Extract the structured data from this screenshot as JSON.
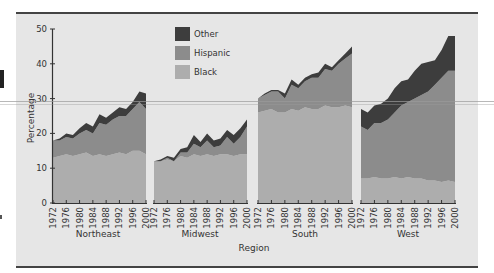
{
  "chart_data": {
    "type": "area",
    "stacked": true,
    "title": "",
    "xlabel": "Region",
    "ylabel": "Percentage",
    "ylim": [
      0,
      50
    ],
    "yticks": [
      0,
      10,
      20,
      30,
      40,
      50
    ],
    "x": [
      1972,
      1974,
      1976,
      1978,
      1980,
      1982,
      1984,
      1986,
      1988,
      1990,
      1992,
      1994,
      1996,
      1998,
      2000
    ],
    "xtick_labels": [
      "1972",
      "1976",
      "1980",
      "1984",
      "1988",
      "1992",
      "1996",
      "2000"
    ],
    "legend": {
      "position": "upper-center",
      "entries": [
        {
          "label": "Other",
          "color": "#3d3d3d"
        },
        {
          "label": "Hispanic",
          "color": "#8c8c8c"
        },
        {
          "label": "Black",
          "color": "#adadad"
        }
      ]
    },
    "panels": [
      {
        "region": "Northeast",
        "series": [
          {
            "name": "Black",
            "values": [
              13,
              13.5,
              14,
              13.5,
              14,
              14.5,
              13.5,
              14,
              13.5,
              14,
              14.5,
              14,
              15,
              15,
              14
            ]
          },
          {
            "name": "Hispanic",
            "values": [
              5,
              4.5,
              5,
              5,
              6,
              6.5,
              6.5,
              9,
              9,
              10,
              10.5,
              11,
              12,
              14,
              13
            ]
          },
          {
            "name": "Other",
            "values": [
              0,
              0.5,
              1,
              1,
              1.5,
              2,
              2,
              2.5,
              2,
              2,
              2.5,
              2,
              2,
              3,
              4.5
            ]
          }
        ],
        "totals": [
          18,
          18.5,
          20,
          19.5,
          21.5,
          23,
          22,
          25.5,
          24.5,
          26,
          27.5,
          27,
          29,
          32,
          31.5
        ]
      },
      {
        "region": "Midwest",
        "series": [
          {
            "name": "Black",
            "values": [
              12,
              12,
              12.5,
              12,
              13.5,
              13,
              14,
              13.5,
              14,
              13.5,
              14,
              14,
              13.5,
              14,
              14
            ]
          },
          {
            "name": "Hispanic",
            "values": [
              0,
              0,
              0.5,
              0,
              1,
              1.5,
              3,
              2.5,
              4,
              2.5,
              2.5,
              5,
              3.5,
              5,
              8
            ]
          },
          {
            "name": "Other",
            "values": [
              0,
              0.5,
              0.5,
              1,
              1,
              1.5,
              2.5,
              1.5,
              2,
              2,
              2,
              2,
              2.5,
              2.5,
              2
            ]
          }
        ],
        "totals": [
          12,
          12.5,
          13.5,
          13,
          15.5,
          16,
          19.5,
          17.5,
          20,
          18,
          18.5,
          21,
          19.5,
          21.5,
          24
        ]
      },
      {
        "region": "South",
        "series": [
          {
            "name": "Black",
            "values": [
              26,
              26.5,
              27,
              26,
              26,
              27,
              26.5,
              27.5,
              27,
              27,
              28,
              27.5,
              27.5,
              28,
              27.5
            ]
          },
          {
            "name": "Hispanic",
            "values": [
              4,
              4.5,
              5,
              6,
              4,
              7,
              6.5,
              7.5,
              9,
              9,
              10.5,
              10.5,
              12.5,
              13.5,
              15.5
            ]
          },
          {
            "name": "Other",
            "values": [
              0,
              0.5,
              0.5,
              0.5,
              1.5,
              1.5,
              1,
              1,
              1,
              1.5,
              1.5,
              1,
              1,
              1.5,
              2
            ]
          }
        ],
        "totals": [
          30,
          31.5,
          32.5,
          32.5,
          31.5,
          35.5,
          34,
          36,
          37,
          37.5,
          40,
          39,
          41,
          43,
          45
        ]
      },
      {
        "region": "West",
        "series": [
          {
            "name": "Black",
            "values": [
              7,
              7,
              7.5,
              7,
              7,
              7.5,
              7,
              7.5,
              7,
              7,
              6.5,
              6.5,
              6,
              6.5,
              6
            ]
          },
          {
            "name": "Hispanic",
            "values": [
              15,
              14,
              15.5,
              16,
              17,
              18.5,
              21,
              21.5,
              23,
              24,
              25.5,
              27.5,
              30,
              31.5,
              32
            ]
          },
          {
            "name": "Other",
            "values": [
              5,
              5,
              5,
              5.5,
              6,
              7,
              7,
              6.5,
              8,
              9,
              8.5,
              7,
              8,
              10,
              10
            ]
          }
        ],
        "totals": [
          27,
          26,
          28,
          28.5,
          30,
          33,
          35,
          35.5,
          38,
          40,
          40.5,
          41,
          44,
          48,
          48
        ]
      }
    ]
  },
  "labels": {
    "ylabel": "Percentage",
    "xlabel": "Region",
    "legend_other": "Other",
    "legend_hispanic": "Hispanic",
    "legend_black": "Black",
    "region_northeast": "Northeast",
    "region_midwest": "Midwest",
    "region_south": "South",
    "region_west": "West"
  },
  "colors": {
    "other": "#3d3d3d",
    "hispanic": "#8c8c8c",
    "black": "#adadad",
    "background": "#e6e6e6",
    "axis": "#333333"
  }
}
